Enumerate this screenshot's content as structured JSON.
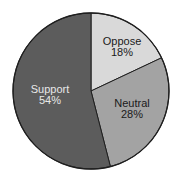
{
  "chart_data": {
    "type": "pie",
    "title": "",
    "categories": [
      "Oppose",
      "Neutral",
      "Support"
    ],
    "values": [
      18,
      28,
      54
    ],
    "unit": "%",
    "start_angle_deg": 0,
    "direction": "clockwise",
    "slices": [
      {
        "label": "Oppose",
        "value": 18,
        "value_label": "18%",
        "color": "#d9d9d9",
        "text_color": "#1a1a1a"
      },
      {
        "label": "Neutral",
        "value": 28,
        "value_label": "28%",
        "color": "#a3a3a3",
        "text_color": "#1a1a1a"
      },
      {
        "label": "Support",
        "value": 54,
        "value_label": "54%",
        "color": "#5c5c5c",
        "text_color": "#e8e8e8"
      }
    ],
    "legend": "none (labels inside slices)"
  },
  "colors": {
    "background": "#ffffff",
    "outline": "#1f1f1f"
  }
}
